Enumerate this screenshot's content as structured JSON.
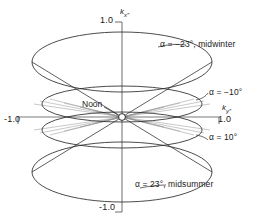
{
  "figure": {
    "background_color": "#ffffff",
    "line_color": "#2b2b2b",
    "axis_color": "#6e6e6e",
    "text_color": "#1a1a1a"
  },
  "axes": {
    "vertical": {
      "label": "k",
      "subscript": "x″",
      "tick_top": "1.0",
      "tick_bottom": "-1.0"
    },
    "horizontal": {
      "label": "k",
      "subscript": "y″",
      "tick_right": "1.0",
      "tick_left": "-1.0"
    }
  },
  "annotations": {
    "origin_marker": "noon-origin-circle",
    "noon": "Noon",
    "midwinter": "α = −23°, midwinter",
    "minus10": "α = −10°",
    "plus10": "α = 10°",
    "midsummer": "α = 23°, midsummer"
  },
  "chart_data": {
    "type": "line",
    "title": "",
    "xlabel": "k_y″",
    "ylabel": "k_x″",
    "xlim": [
      -1.0,
      1.0
    ],
    "ylim": [
      -1.0,
      1.0
    ],
    "grid": false,
    "legend_position": "inline-right",
    "series": [
      {
        "name": "α = −23°, midwinter",
        "declination_deg": -23,
        "season": "midwinter",
        "ellipse": {
          "cx": 122,
          "cy": 62,
          "rx": 90,
          "ry": 30
        }
      },
      {
        "name": "α = −10°",
        "declination_deg": -10,
        "season": "",
        "ellipse": {
          "cx": 122,
          "cy": 104,
          "rx": 80,
          "ry": 18
        }
      },
      {
        "name": "α = 10°",
        "declination_deg": 10,
        "season": "",
        "ellipse": {
          "cx": 122,
          "cy": 130,
          "rx": 80,
          "ry": 18
        }
      },
      {
        "name": "α = 23°, midsummer",
        "declination_deg": 23,
        "season": "midsummer",
        "ellipse": {
          "cx": 122,
          "cy": 172,
          "rx": 90,
          "ry": 30
        }
      }
    ],
    "origin": {
      "x": 0.0,
      "y": 0.0,
      "label": "Noon"
    }
  }
}
